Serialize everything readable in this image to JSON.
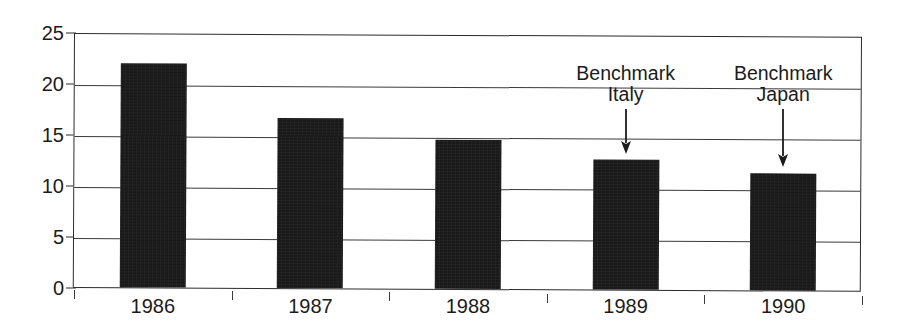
{
  "chart_data": {
    "type": "bar",
    "title": "",
    "subtitle": "",
    "xlabel": "",
    "ylabel": "",
    "categories": [
      "1986",
      "1987",
      "1988",
      "1989",
      "1990"
    ],
    "values": [
      22.0,
      16.7,
      14.6,
      12.7,
      11.5
    ],
    "series": [
      {
        "name": "",
        "values": [
          22.0,
          16.7,
          14.6,
          12.7,
          11.5
        ]
      }
    ],
    "ylim": [
      0,
      25
    ],
    "ytick_labels": [
      "0",
      "5",
      "10",
      "15",
      "20",
      "25"
    ],
    "ytick_values": [
      0,
      5,
      10,
      15,
      20,
      25
    ],
    "xtick_labels": [
      "1986",
      "1987",
      "1988",
      "1989",
      "1990"
    ],
    "grid": true,
    "grid_axis": "y",
    "legend": false,
    "legend_position": "none",
    "bar_color": "#191919",
    "axis_color": "#2b2b2b",
    "background_color": "#ffffff",
    "annotations": [
      {
        "line1": "Benchmark",
        "line2": "Italy",
        "target_category": "1989",
        "target_value": 12.7,
        "arrow": "down-arrow"
      },
      {
        "line1": "Benchmark",
        "line2": "Japan",
        "target_category": "1990",
        "target_value": 11.5,
        "arrow": "down-arrow"
      }
    ]
  }
}
